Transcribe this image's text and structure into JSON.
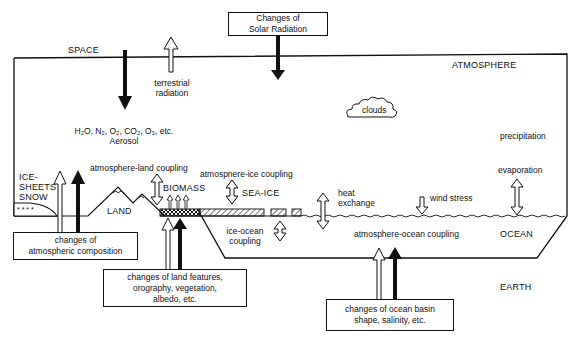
{
  "diagram": {
    "type": "climate-system-schematic",
    "regions": {
      "space": "SPACE",
      "atmosphere": "ATMOSPHERE",
      "ocean": "OCEAN",
      "earth": "EARTH",
      "land": "LAND",
      "biomass": "BIOMASS",
      "sea_ice": "SEA-ICE",
      "ice_sheets_line1": "ICE-",
      "ice_sheets_line2": "SHEETS",
      "ice_sheets_line3": "SNOW"
    },
    "processes": {
      "terrestrial_line1": "terrestrial",
      "terrestrial_line2": "radiation",
      "composition_line1": "H₂O, N₂, O₂, CO₂, O₃, etc.",
      "composition_line2": "Aerosol",
      "clouds": "clouds",
      "precipitation": "precipitation",
      "evaporation": "evaporation",
      "atmosphere_land": "atmosphere-land coupling",
      "atmosphere_ice": "atmospnere-ice coupling",
      "heat_line1": "heat",
      "heat_line2": "exchange",
      "wind_stress": "wind stress",
      "ice_ocean_line1": "ice-ocean",
      "ice_ocean_line2": "coupling",
      "atmosphere_ocean": "atmosphere-ocean coupling"
    },
    "external_forcings": {
      "solar_line1": "Changes of",
      "solar_line2": "Solar Radiation",
      "atmos_comp_line1": "changes of",
      "atmos_comp_line2": "atmospheric composition",
      "land_line1": "changes of land features,",
      "land_line2": "orography, vegetation,",
      "land_line3": "albedo, etc.",
      "ocean_line1": "changes of ocean basin",
      "ocean_line2": "shape, salinity, etc."
    }
  }
}
